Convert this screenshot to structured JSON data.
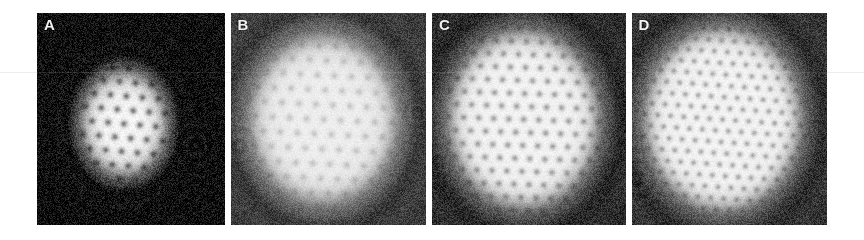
{
  "figure": {
    "background_color": "#ffffff",
    "width": 864,
    "height": 240,
    "rule_color": "#ededed",
    "rule_y": 72,
    "label_color": "#f2f2f2",
    "panel_gap": 6,
    "panel_top": 13,
    "panel_left": 37,
    "panel_height": 212
  },
  "panels": [
    {
      "label": "A",
      "x": 37,
      "width": 188,
      "background_level": "#0c0c0c",
      "noise_level": 0.3,
      "cloud": {
        "cx": 0.46,
        "cy": 0.52,
        "rx": 0.24,
        "ry": 0.26,
        "peak_brightness": 0.96,
        "edge_softness": 0.42
      },
      "lattice": {
        "spacing_px": 16,
        "core_radius_px": 3.6,
        "rotation_deg": 5,
        "core_depth": 0.55,
        "visible_count": 16
      },
      "rings": [
        {
          "cx": 0.84,
          "cy": 0.62,
          "r": 0.085,
          "strength": 0.55
        },
        {
          "cx": 0.3,
          "cy": 0.84,
          "r": 0.1,
          "strength": 0.3
        }
      ]
    },
    {
      "label": "B",
      "x": 231,
      "width": 196,
      "background_level": "#3c3c3c",
      "noise_level": 0.22,
      "cloud": {
        "cx": 0.47,
        "cy": 0.5,
        "rx": 0.39,
        "ry": 0.41,
        "peak_brightness": 0.93,
        "edge_softness": 0.3
      },
      "lattice": {
        "spacing_px": 17,
        "core_radius_px": 3.8,
        "rotation_deg": 3,
        "core_depth": 0.22,
        "visible_count": 38
      },
      "rings": [
        {
          "cx": 0.95,
          "cy": 0.47,
          "r": 0.07,
          "strength": 0.4
        },
        {
          "cx": 0.04,
          "cy": 0.63,
          "r": 0.09,
          "strength": 0.45
        }
      ]
    },
    {
      "label": "C",
      "x": 433,
      "width": 194,
      "background_level": "#2c2c2c",
      "noise_level": 0.24,
      "cloud": {
        "cx": 0.47,
        "cy": 0.5,
        "rx": 0.4,
        "ry": 0.43,
        "peak_brightness": 0.95,
        "edge_softness": 0.26
      },
      "lattice": {
        "spacing_px": 15,
        "core_radius_px": 3.4,
        "rotation_deg": 2,
        "core_depth": 0.42,
        "visible_count": 62
      },
      "rings": [
        {
          "cx": 0.03,
          "cy": 0.7,
          "r": 0.08,
          "strength": 0.4
        },
        {
          "cx": 0.93,
          "cy": 0.37,
          "r": 0.05,
          "strength": 0.25
        }
      ]
    },
    {
      "label": "D",
      "x": 631,
      "width": 196,
      "background_level": "#333333",
      "noise_level": 0.24,
      "cloud": {
        "cx": 0.46,
        "cy": 0.5,
        "rx": 0.41,
        "ry": 0.44,
        "peak_brightness": 0.95,
        "edge_softness": 0.24
      },
      "lattice": {
        "spacing_px": 13,
        "core_radius_px": 3.0,
        "rotation_deg": 4,
        "core_depth": 0.4,
        "visible_count": 88
      },
      "rings": [
        {
          "cx": 0.02,
          "cy": 0.78,
          "r": 0.09,
          "strength": 0.45
        },
        {
          "cx": 0.05,
          "cy": 0.28,
          "r": 0.06,
          "strength": 0.25
        }
      ]
    }
  ]
}
